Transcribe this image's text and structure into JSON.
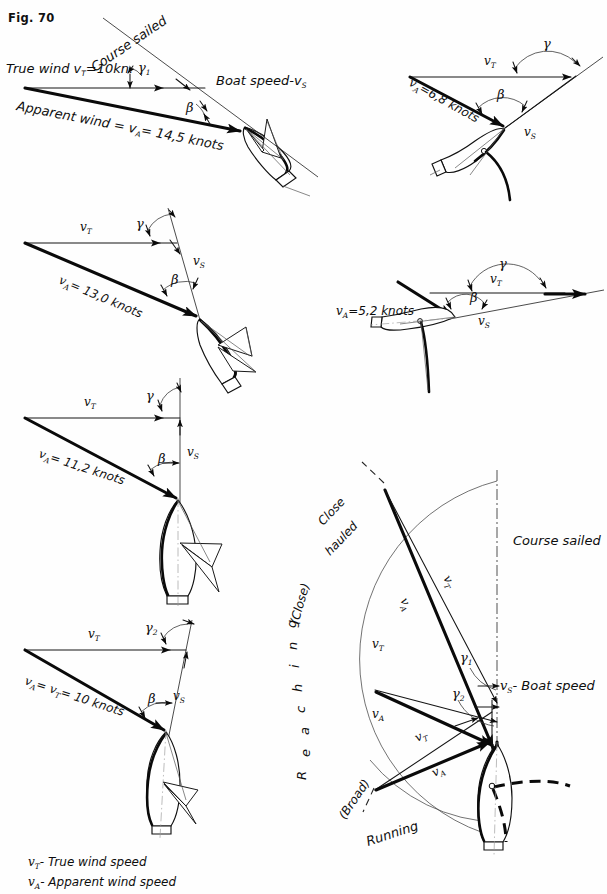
{
  "figure": {
    "label": "Fig. 70",
    "domain": "sailing-vector-diagram"
  },
  "symbols": {
    "v": "v",
    "T": "T",
    "A": "A",
    "S": "S",
    "vT": "v",
    "vA": "v",
    "vS": "v",
    "gamma": "γ",
    "beta": "β",
    "one": "1",
    "two": "2"
  },
  "panels": [
    {
      "id": "panel-1-close-hauled",
      "labels": {
        "true_wind": "True wind v",
        "true_wind_sub": "T",
        "true_wind_value": "=10kn.",
        "course_sailed": "Course sailed",
        "boat_speed": "Boat speed-v",
        "boat_speed_sub": "S",
        "apparent_wind": "Apparent wind = v",
        "apparent_wind_sub": "A",
        "apparent_wind_value": "= 14,5 knots",
        "angle_gamma": "γ",
        "angle_gamma_sub": "1",
        "angle_beta": "β"
      }
    },
    {
      "id": "panel-2-beam-reach",
      "labels": {
        "vT": "v",
        "vT_sub": "T",
        "vS": "v",
        "vS_sub": "S",
        "vA_value": "=6,8 knots",
        "vA": "v",
        "vA_sub": "A",
        "angle_gamma": "γ",
        "angle_beta": "β"
      }
    },
    {
      "id": "panel-3-close-reach",
      "labels": {
        "vT": "v",
        "vT_sub": "T",
        "vS": "v",
        "vS_sub": "S",
        "vA": "v",
        "vA_sub": "A",
        "vA_value": "= 13,0 knots",
        "angle_gamma": "γ",
        "angle_beta": "β"
      }
    },
    {
      "id": "panel-4-broad-reach",
      "labels": {
        "vT": "v",
        "vT_sub": "T",
        "vS": "v",
        "vS_sub": "S",
        "vA": "v",
        "vA_sub": "A",
        "vA_value": "=5,2 knots",
        "angle_gamma": "γ",
        "angle_beta": "β"
      }
    },
    {
      "id": "panel-5-beam",
      "labels": {
        "vT": "v",
        "vT_sub": "T",
        "vS": "v",
        "vS_sub": "S",
        "vA": "v",
        "vA_sub": "A",
        "vA_value": "= 11,2 knots",
        "angle_gamma": "γ",
        "angle_beta": "β"
      }
    },
    {
      "id": "panel-6-running",
      "labels": {
        "vT": "v",
        "vT_sub": "T",
        "vS": "v",
        "vS_sub": "S",
        "vA_vT": "v",
        "vA_sub": "A",
        "vA_eq": "= v",
        "vA_eq_sub": "T",
        "vA_value": "= 10 knots",
        "angle_gamma": "γ",
        "angle_gamma_sub": "2",
        "angle_beta": "β"
      }
    },
    {
      "id": "panel-7-polar",
      "labels": {
        "close_hauled": "Close",
        "close_hauled_2": "hauled",
        "close": "(Close)",
        "reaching": "R e a c h i n g",
        "broad": "(Broad)",
        "running": "Running",
        "course_sailed": "Course sailed",
        "boat_speed": "- Boat speed",
        "boat_speed_sym": "v",
        "boat_speed_sub": "S",
        "vT": "v",
        "vT_sub": "T",
        "vA": "v",
        "vA_sub": "A",
        "gamma1": "γ",
        "gamma1_sub": "1",
        "gamma2": "γ",
        "gamma2_sub": "2"
      }
    }
  ],
  "legend": {
    "items": [
      {
        "symbol": "v",
        "sub": "T",
        "dash": "- True wind speed"
      },
      {
        "symbol": "v",
        "sub": "A",
        "dash": "- Apparent wind speed"
      }
    ]
  }
}
